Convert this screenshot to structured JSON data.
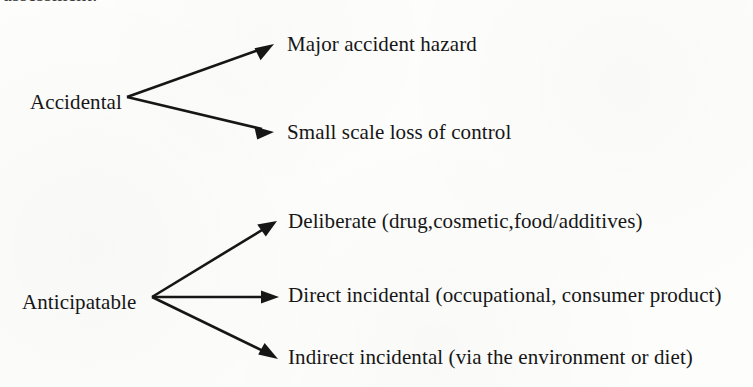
{
  "figure": {
    "type": "classification-tree",
    "orientation": "left-to-right",
    "background_color": "#fdfdfc",
    "ink_color": "#161616",
    "clipped_header_text": "assessment:",
    "branch_count": 2,
    "leaf_count": 5
  },
  "nodes": {
    "accidental": {
      "label": "Accidental",
      "x": 30,
      "y": 103
    },
    "anticipatable": {
      "label": "Anticipatable",
      "x": 22,
      "y": 303
    }
  },
  "leaves": [
    {
      "id": "major-accident-hazard",
      "label": "Major accident hazard",
      "parent": "Accidental",
      "x": 287,
      "y": 52
    },
    {
      "id": "small-scale-loss-of-control",
      "label": "Small scale loss of control",
      "parent": "Accidental",
      "x": 287,
      "y": 140
    },
    {
      "id": "deliberate",
      "label": "Deliberate (drug,cosmetic,food/additives)",
      "parent": "Anticipatable",
      "x": 288,
      "y": 229
    },
    {
      "id": "direct-incidental",
      "label": "Direct incidental (occupational, consumer product)",
      "parent": "Anticipatable",
      "x": 288,
      "y": 303
    },
    {
      "id": "indirect-incidental",
      "label": "Indirect incidental (via the environment or diet)",
      "parent": "Anticipatable",
      "x": 288,
      "y": 365
    }
  ],
  "connectors": [
    {
      "id": "accidental-to-major-accident-hazard",
      "from_x": 127,
      "from_y": 97,
      "to_x": 274,
      "to_y": 44,
      "arrowhead": "filled-triangle"
    },
    {
      "id": "accidental-to-small-scale-loss-of-control",
      "from_x": 127,
      "from_y": 97,
      "to_x": 274,
      "to_y": 132,
      "arrowhead": "filled-triangle"
    },
    {
      "id": "anticipatable-to-deliberate",
      "from_x": 152,
      "from_y": 297,
      "to_x": 277,
      "to_y": 221,
      "arrowhead": "filled-triangle"
    },
    {
      "id": "anticipatable-to-direct-incidental",
      "from_x": 152,
      "from_y": 297,
      "to_x": 279,
      "to_y": 297,
      "arrowhead": "filled-triangle"
    },
    {
      "id": "anticipatable-to-indirect-incidental",
      "from_x": 152,
      "from_y": 297,
      "to_x": 278,
      "to_y": 359,
      "arrowhead": "filled-triangle"
    }
  ]
}
